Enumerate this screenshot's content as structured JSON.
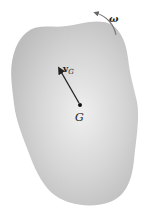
{
  "diagram": {
    "body": {
      "fill": "#c4c4c4",
      "highlight": "#efefef"
    },
    "center_of_mass": {
      "label": "G"
    },
    "velocity": {
      "label_main": "v",
      "label_sub": "G"
    },
    "angular_velocity": {
      "label": "ω"
    }
  }
}
